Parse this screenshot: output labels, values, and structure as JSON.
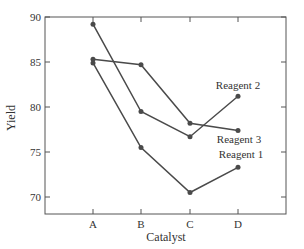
{
  "chart_data": {
    "type": "line",
    "title": "",
    "xlabel": "Catalyst",
    "ylabel": "Yield",
    "categories": [
      "A",
      "B",
      "C",
      "D"
    ],
    "ylim": [
      68,
      90
    ],
    "yticks": [
      70,
      75,
      80,
      85,
      90
    ],
    "grid": false,
    "legend": "inline labels at right",
    "series": [
      {
        "name": "Reagent 1",
        "values": [
          84.9,
          75.5,
          70.5,
          73.3
        ]
      },
      {
        "name": "Reagent 2",
        "values": [
          89.2,
          79.5,
          76.7,
          81.2
        ]
      },
      {
        "name": "Reagent 3",
        "values": [
          85.3,
          84.7,
          78.2,
          77.4
        ]
      }
    ],
    "colors": {
      "line": "#4a4a4a",
      "axis": "#555555"
    }
  }
}
